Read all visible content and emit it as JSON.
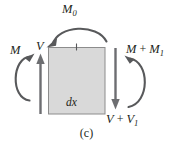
{
  "figure": {
    "caption": "(c)",
    "element": {
      "name": "differential-beam-element",
      "inner_label": "dx",
      "fill_color": "#d9d9d9",
      "stroke_color": "#808080",
      "rect": {
        "x": 48,
        "y": 47,
        "width": 57,
        "height": 67
      }
    },
    "stroke_color": "#58595b",
    "labels": {
      "applied_moment": {
        "base": "M",
        "sub": "0",
        "full": "M0"
      },
      "left_moment": {
        "base": "M",
        "sub": "",
        "full": "M"
      },
      "left_shear": {
        "base": "V",
        "sub": "",
        "full": "V"
      },
      "right_moment": {
        "base": "M",
        "op": " + ",
        "term2": "M",
        "sub": "1",
        "full": "M + M1"
      },
      "right_shear": {
        "base": "V",
        "op": " + ",
        "term2": "V",
        "sub": "1",
        "full": "V + V1"
      }
    },
    "forces": [
      {
        "name": "applied-moment-arc",
        "label": "M0",
        "type": "moment",
        "sense": "counterclockwise",
        "position": "top"
      },
      {
        "name": "left-moment-arc",
        "label": "M",
        "type": "moment",
        "sense": "counterclockwise",
        "position": "left"
      },
      {
        "name": "left-shear-arrow",
        "label": "V",
        "type": "shear",
        "direction": "up",
        "position": "left"
      },
      {
        "name": "right-moment-arc",
        "label": "M + M1",
        "type": "moment",
        "sense": "clockwise",
        "position": "right"
      },
      {
        "name": "right-shear-arrow",
        "label": "V + V1",
        "type": "shear",
        "direction": "down",
        "position": "right"
      }
    ]
  }
}
